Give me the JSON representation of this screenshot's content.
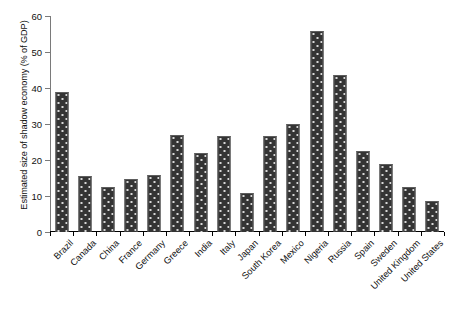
{
  "chart_data": {
    "type": "bar",
    "title": "",
    "xlabel": "",
    "ylabel": "Estimated size of shadow economy (% of GDP)",
    "ylim": [
      0,
      60
    ],
    "ytick_values": [
      0,
      10,
      20,
      30,
      40,
      50,
      60
    ],
    "ytick_labels": [
      "0",
      "10",
      "20",
      "30",
      "40",
      "50",
      "60"
    ],
    "grid": false,
    "legend": false,
    "bar_color": "#343434",
    "bar_edge_color": "#5d5d5d",
    "bar_pattern": "dotted-fill",
    "axis_color": "#000000",
    "categories": [
      "Brazil",
      "Canada",
      "China",
      "France",
      "Germany",
      "Greece",
      "India",
      "Italy",
      "Japan",
      "South Korea",
      "Mexico",
      "Nigeria",
      "Russia",
      "Spain",
      "Sweden",
      "United Kingdom",
      "United States"
    ],
    "values": [
      38.9,
      15.6,
      12.6,
      14.8,
      15.9,
      26.9,
      21.9,
      26.7,
      10.8,
      26.7,
      30.0,
      55.8,
      43.6,
      22.4,
      18.8,
      12.4,
      8.5
    ]
  },
  "caption": {
    "text": ""
  }
}
